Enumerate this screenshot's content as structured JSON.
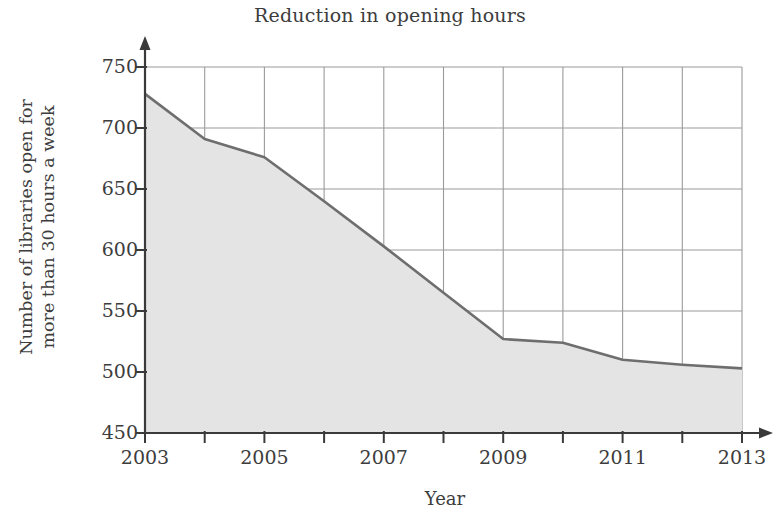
{
  "chart_data": {
    "type": "area",
    "title": "Reduction in opening hours",
    "xlabel": "Year",
    "ylabel": "Number of libraries open for more than 30 hours a week",
    "ylabel_line1": "Number of libraries open for",
    "ylabel_line2": "more than 30 hours a week",
    "x": [
      2003,
      2004,
      2005,
      2006,
      2007,
      2008,
      2009,
      2010,
      2011,
      2012,
      2013
    ],
    "values": [
      728,
      691,
      676,
      640,
      603,
      565,
      527,
      524,
      510,
      506,
      503
    ],
    "series": [
      {
        "name": "Libraries open more than 30 hours a week",
        "values": [
          728,
          691,
          676,
          640,
          603,
          565,
          527,
          524,
          510,
          506,
          503
        ]
      }
    ],
    "xlim": [
      2003,
      2013
    ],
    "ylim": [
      450,
      750
    ],
    "x_ticks": [
      2003,
      2004,
      2005,
      2006,
      2007,
      2008,
      2009,
      2010,
      2011,
      2012,
      2013
    ],
    "x_tick_labels": [
      "2003",
      "",
      "2005",
      "",
      "2007",
      "",
      "2009",
      "",
      "2011",
      "",
      "2013"
    ],
    "y_ticks": [
      450,
      500,
      550,
      600,
      650,
      700,
      750
    ],
    "y_tick_labels": [
      "450",
      "500",
      "550",
      "600",
      "650",
      "700",
      "750"
    ],
    "grid": true,
    "legend": "none",
    "fill_color": "#e4e4e4",
    "line_color": "#6e6e6e",
    "grid_color": "#9a9a9a",
    "axis_color": "#3a3a3a"
  },
  "axes": {
    "y_labels": [
      "750",
      "700",
      "650",
      "600",
      "550",
      "500",
      "450"
    ],
    "x_labels": [
      "2003",
      "2005",
      "2007",
      "2009",
      "2011",
      "2013"
    ]
  },
  "scan_artifact": {
    "top_ghost_text": ""
  }
}
